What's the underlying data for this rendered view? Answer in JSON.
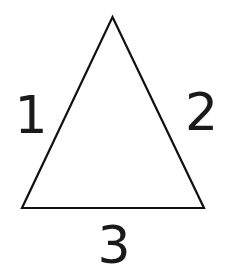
{
  "figure": {
    "kind": "geometry-diagram",
    "shape_name": "triangle",
    "background_color": "#ffffff",
    "stroke_color": "#111111",
    "label_color": "#1a1a1a",
    "stroke_width": 2.2,
    "canvas": {
      "width": 225,
      "height": 278
    }
  },
  "triangle": {
    "vertices": [
      {
        "name": "apex",
        "x": 112.5,
        "y": 17
      },
      {
        "name": "bottom-right",
        "x": 204,
        "y": 208
      },
      {
        "name": "bottom-left",
        "x": 22,
        "y": 208
      }
    ],
    "points_attr": "112.5,17 204,208 22,208"
  },
  "labels": {
    "left": {
      "text": "1",
      "side": "left-edge"
    },
    "right": {
      "text": "2",
      "side": "right-edge"
    },
    "bottom": {
      "text": "3",
      "side": "base-edge"
    }
  }
}
